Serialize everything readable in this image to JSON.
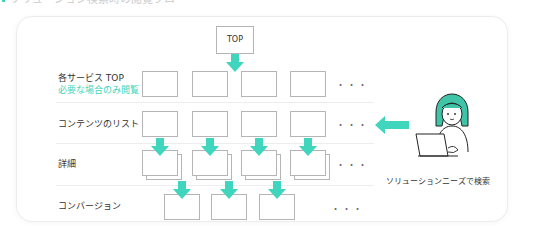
{
  "title": {
    "text": "ソリューション検索時の閲覧フロー",
    "accent_color": "#3fd6bd"
  },
  "diagram": {
    "top_node": "TOP",
    "rows": [
      {
        "label": "各サービス TOP",
        "sub_label": "必要な場合のみ閲覧",
        "boxes": 4,
        "ellipsis": "・・・"
      },
      {
        "label": "コンテンツのリスト",
        "boxes": 4,
        "ellipsis": "・・・"
      },
      {
        "label": "詳細",
        "boxes": 4,
        "stacked": true,
        "ellipsis": "・・・"
      },
      {
        "label": "コンバージョン",
        "boxes": 3,
        "ellipsis": "・・・"
      }
    ],
    "user": {
      "icon": "woman-with-laptop-icon",
      "caption": "ソリューションニーズで検索"
    },
    "colors": {
      "arrow": "#3fd6bd",
      "box_border": "#b5b5b5",
      "hair": "#3fc4a8"
    }
  }
}
